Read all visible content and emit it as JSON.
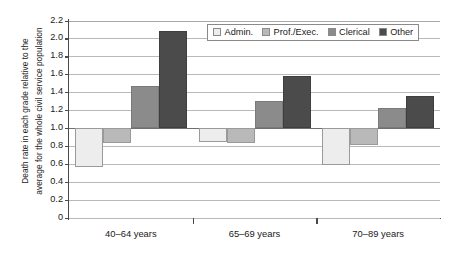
{
  "chart_data": {
    "type": "bar",
    "title": "",
    "xlabel": "",
    "ylabel_line_1": "Death rate in each grade relative to the",
    "ylabel_line_2": "average for the whole civil service population",
    "categories": [
      "40–64 years",
      "65–69 years",
      "70–89 years"
    ],
    "series": [
      {
        "name": "Admin.",
        "color": "#ededed",
        "values": [
          0.57,
          0.85,
          0.59
        ]
      },
      {
        "name": "Prof./Exec.",
        "color": "#b9b9b9",
        "values": [
          0.84,
          0.84,
          0.82
        ]
      },
      {
        "name": "Clerical",
        "color": "#8b8b8b",
        "values": [
          1.47,
          1.31,
          1.23
        ]
      },
      {
        "name": "Other",
        "color": "#4b4b4b",
        "values": [
          2.09,
          1.59,
          1.36
        ]
      }
    ],
    "ylim": [
      0,
      2.2
    ],
    "yticks": [
      0,
      0.2,
      0.4,
      0.6,
      0.8,
      1.0,
      1.2,
      1.4,
      1.6,
      1.8,
      2.0,
      2.2
    ],
    "ytick_labels": [
      "0",
      "0.2",
      "0.4",
      "0.6",
      "0.8",
      "1.0",
      "1.2",
      "1.4",
      "1.6",
      "1.8",
      "2.0",
      "2.2"
    ],
    "baseline": 1.0,
    "grid": true,
    "legend_position": "top-right",
    "bar_orientation": "vertical-anchored-at-1.0"
  }
}
